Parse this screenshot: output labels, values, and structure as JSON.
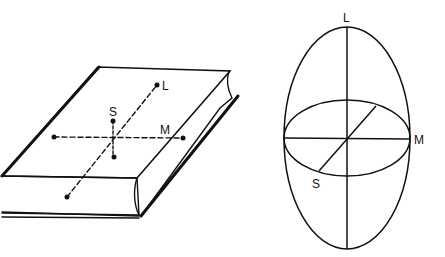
{
  "figure": {
    "book": {
      "labels": {
        "long_axis": "L",
        "medium_axis": "M",
        "short_axis": "S"
      }
    },
    "ellipsoid": {
      "labels": {
        "long_axis": "L",
        "medium_axis": "M",
        "short_axis": "S"
      }
    }
  },
  "colors": {
    "stroke": "#111111",
    "background": "#ffffff"
  }
}
